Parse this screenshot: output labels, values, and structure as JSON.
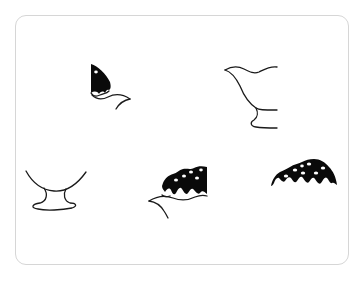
{
  "puzzle": {
    "title": "Picture fragments puzzle",
    "subject": "ice cream sundae",
    "colors": {
      "ink": "#0a0a0a",
      "outline": "#1a1a1a",
      "card_border": "#d6d6d6",
      "background": "#ffffff"
    },
    "pieces": [
      {
        "id": "piece-1",
        "label": "Piece 1",
        "depicts": "left edge of topping with one sprinkle and cup rim"
      },
      {
        "id": "piece-2",
        "label": "Piece 2",
        "depicts": "right side of cup outline with stem and base"
      },
      {
        "id": "piece-3",
        "label": "Piece 3",
        "depicts": "bottom of bowl with stem and base"
      },
      {
        "id": "piece-4",
        "label": "Piece 4",
        "depicts": "topping with sprinkles over cup rim"
      },
      {
        "id": "piece-5",
        "label": "Piece 5",
        "depicts": "dome of dark topping with sprinkles"
      }
    ]
  }
}
